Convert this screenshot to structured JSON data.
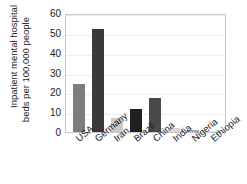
{
  "chart_data": {
    "type": "bar",
    "title": "",
    "xlabel": "",
    "ylabel_line1": "Inpatient mental hospital",
    "ylabel_line2": "beds per 100,000 people",
    "categories": [
      "USA",
      "Germany",
      "Iran",
      "Brazil",
      "China",
      "India",
      "Nigeria",
      "Ethiopia"
    ],
    "values": [
      24,
      52,
      7,
      11.5,
      17,
      2,
      1,
      0.3
    ],
    "bar_colors": [
      "#7d7d7d",
      "#3a3a3a",
      "#c9c9c9",
      "#202020",
      "#4a4a4a",
      "#d6d6d6",
      "#a9a9a9",
      "#e4e4e4"
    ],
    "ylim": [
      0,
      60
    ],
    "yticks": [
      60,
      50,
      40,
      30,
      20,
      10,
      0
    ],
    "ytick_labels": [
      "60",
      "50",
      "40",
      "30",
      "20",
      "10",
      "0"
    ],
    "grid": true,
    "legend": "none"
  }
}
